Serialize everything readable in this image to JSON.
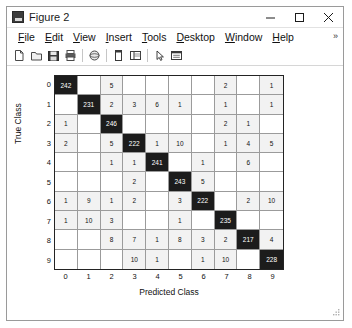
{
  "window": {
    "title": "Figure 2",
    "icon": "matlab-figure-icon",
    "minimize_label": "─",
    "maximize_label": "□",
    "close_label": "✕"
  },
  "menubar": {
    "items": [
      {
        "label": "File",
        "mnemonic": "F"
      },
      {
        "label": "Edit",
        "mnemonic": "E"
      },
      {
        "label": "View",
        "mnemonic": "V"
      },
      {
        "label": "Insert",
        "mnemonic": "I"
      },
      {
        "label": "Tools",
        "mnemonic": "T"
      },
      {
        "label": "Desktop",
        "mnemonic": "D"
      },
      {
        "label": "Window",
        "mnemonic": "W"
      },
      {
        "label": "Help",
        "mnemonic": "H"
      }
    ],
    "overflow_label": "»"
  },
  "toolbar": {
    "buttons": [
      {
        "name": "new-figure-icon",
        "tooltip": "New Figure"
      },
      {
        "name": "open-file-icon",
        "tooltip": "Open File"
      },
      {
        "name": "save-figure-icon",
        "tooltip": "Save Figure"
      },
      {
        "name": "print-figure-icon",
        "tooltip": "Print Figure"
      },
      {
        "name": "rotate-3d-icon",
        "tooltip": "Rotate 3D"
      },
      {
        "name": "data-cursor-icon",
        "tooltip": "Data Cursor"
      },
      {
        "name": "insert-colorbar-icon",
        "tooltip": "Insert Colorbar"
      },
      {
        "name": "pointer-arrow-icon",
        "tooltip": "Edit Plot"
      },
      {
        "name": "insert-legend-icon",
        "tooltip": "Insert Legend"
      }
    ]
  },
  "chart_data": {
    "type": "heatmap",
    "title": "",
    "xlabel": "Predicted Class",
    "ylabel": "True Class",
    "categories": [
      "0",
      "1",
      "2",
      "3",
      "4",
      "5",
      "6",
      "7",
      "8",
      "9"
    ],
    "row_labels": [
      "0",
      "1",
      "2",
      "3",
      "4",
      "5",
      "6",
      "7",
      "8",
      "9"
    ],
    "col_labels": [
      "0",
      "1",
      "2",
      "3",
      "4",
      "5",
      "6",
      "7",
      "8",
      "9"
    ],
    "grid": true,
    "legend_position": "none",
    "colors": {
      "diagonal_fill": "#1c1c1c",
      "diagonal_text": "#ffffff",
      "offdiagonal_fill": "#f2f2f2",
      "empty_fill": "#ffffff",
      "text": "#111111",
      "gridline": "#9b9b9b",
      "axis": "#232323"
    },
    "values": [
      [
        242,
        null,
        5,
        null,
        null,
        null,
        null,
        2,
        null,
        1
      ],
      [
        null,
        231,
        2,
        3,
        6,
        1,
        null,
        1,
        null,
        1
      ],
      [
        1,
        null,
        246,
        null,
        null,
        null,
        null,
        2,
        1,
        null
      ],
      [
        2,
        null,
        5,
        222,
        1,
        10,
        null,
        1,
        4,
        5
      ],
      [
        null,
        null,
        1,
        1,
        241,
        null,
        1,
        null,
        6,
        null
      ],
      [
        null,
        null,
        null,
        2,
        null,
        243,
        5,
        null,
        null,
        null
      ],
      [
        1,
        9,
        1,
        2,
        null,
        3,
        222,
        null,
        2,
        10
      ],
      [
        1,
        10,
        3,
        null,
        null,
        1,
        null,
        235,
        null,
        null
      ],
      [
        null,
        null,
        8,
        7,
        1,
        8,
        3,
        2,
        217,
        4
      ],
      [
        null,
        null,
        null,
        10,
        1,
        null,
        1,
        10,
        null,
        228
      ]
    ]
  }
}
